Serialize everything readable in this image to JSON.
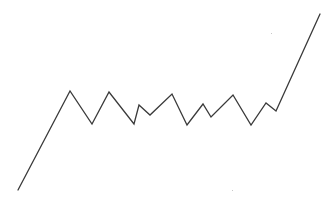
{
  "diagram": {
    "line_color": "#3a3a3a",
    "background": "#ffffff",
    "stroke_width": 1.3,
    "points": [
      [
        18,
        190
      ],
      [
        70,
        91
      ],
      [
        92,
        124
      ],
      [
        109,
        92
      ],
      [
        134,
        124
      ],
      [
        139,
        105
      ],
      [
        150,
        115
      ],
      [
        172,
        94
      ],
      [
        187,
        125
      ],
      [
        203,
        104
      ],
      [
        211,
        117
      ],
      [
        233,
        95
      ],
      [
        251,
        125
      ],
      [
        266,
        103
      ],
      [
        276,
        111
      ],
      [
        320,
        14
      ]
    ],
    "specks": [
      [
        271,
        33
      ],
      [
        232,
        190
      ]
    ]
  }
}
